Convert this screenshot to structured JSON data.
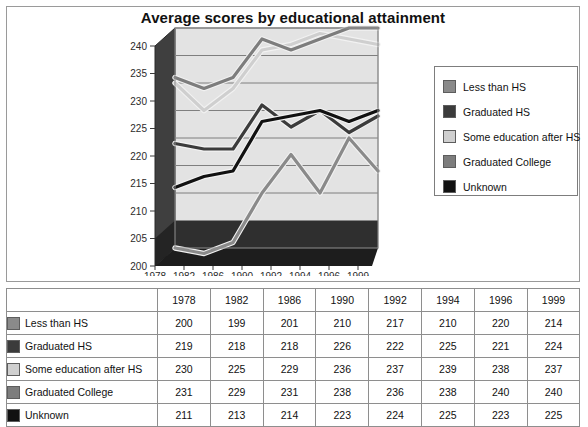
{
  "chart_data": {
    "type": "line",
    "title": "Average scores by educational attainment",
    "xlabel": "",
    "ylabel": "",
    "categories": [
      "1978",
      "1982",
      "1986",
      "1990",
      "1992",
      "1994",
      "1996",
      "1999"
    ],
    "ylim": [
      200,
      240
    ],
    "yticks": [
      200,
      205,
      210,
      215,
      220,
      225,
      230,
      235,
      240
    ],
    "grid": true,
    "legend_position": "right",
    "style": "3d-line",
    "series": [
      {
        "name": "Less than HS",
        "values": [
          200,
          199,
          201,
          210,
          217,
          210,
          220,
          214
        ],
        "color": "#8a8a8a"
      },
      {
        "name": "Graduated HS",
        "values": [
          219,
          218,
          218,
          226,
          222,
          225,
          221,
          224
        ],
        "color": "#3b3b3b"
      },
      {
        "name": "Some education after HS",
        "values": [
          230,
          225,
          229,
          236,
          237,
          239,
          238,
          237
        ],
        "color": "#cfcfcf"
      },
      {
        "name": "Graduated College",
        "values": [
          231,
          229,
          231,
          238,
          236,
          238,
          240,
          240
        ],
        "color": "#7d7d7d"
      },
      {
        "name": "Unknown",
        "values": [
          211,
          213,
          214,
          223,
          224,
          225,
          223,
          225
        ],
        "color": "#111111"
      }
    ]
  },
  "legend": {
    "items": [
      {
        "label": "Less than HS"
      },
      {
        "label": "Graduated HS"
      },
      {
        "label": "Some education after HS"
      },
      {
        "label": "Graduated College"
      },
      {
        "label": "Unknown"
      }
    ]
  },
  "table": {
    "corner_label": "",
    "columns": [
      "1978",
      "1982",
      "1986",
      "1990",
      "1992",
      "1994",
      "1996",
      "1999"
    ],
    "rows": [
      {
        "label": "Less than HS",
        "values": [
          "200",
          "199",
          "201",
          "210",
          "217",
          "210",
          "220",
          "214"
        ]
      },
      {
        "label": "Graduated HS",
        "values": [
          "219",
          "218",
          "218",
          "226",
          "222",
          "225",
          "221",
          "224"
        ]
      },
      {
        "label": "Some education after HS",
        "values": [
          "230",
          "225",
          "229",
          "236",
          "237",
          "239",
          "238",
          "237"
        ]
      },
      {
        "label": "Graduated College",
        "values": [
          "231",
          "229",
          "231",
          "238",
          "236",
          "238",
          "240",
          "240"
        ]
      },
      {
        "label": "Unknown",
        "values": [
          "211",
          "213",
          "214",
          "223",
          "224",
          "225",
          "223",
          "225"
        ]
      }
    ]
  }
}
